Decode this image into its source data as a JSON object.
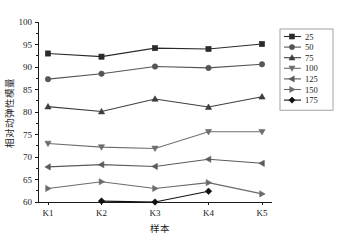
{
  "chart_data": {
    "type": "line",
    "title": "",
    "xlabel": "样本",
    "ylabel": "相对动弹性模量",
    "categories": [
      "K1",
      "K2",
      "K3",
      "K4",
      "K5"
    ],
    "ylim": [
      60,
      100
    ],
    "yticks": [
      60,
      65,
      70,
      75,
      80,
      85,
      90,
      95,
      100
    ],
    "grid": false,
    "legend_position": "right",
    "series": [
      {
        "name": "25",
        "marker": "square",
        "color": "#2b2b2b",
        "values": [
          93.0,
          92.3,
          94.2,
          94.0,
          95.1
        ]
      },
      {
        "name": "50",
        "marker": "circle",
        "color": "#555555",
        "values": [
          87.3,
          88.5,
          90.1,
          89.8,
          90.6
        ]
      },
      {
        "name": "75",
        "marker": "triangle-up",
        "color": "#3d3d3d",
        "values": [
          81.2,
          80.1,
          82.9,
          81.1,
          83.4
        ]
      },
      {
        "name": "100",
        "marker": "triangle-down",
        "color": "#6e6e6e",
        "values": [
          73.0,
          72.2,
          71.9,
          75.6,
          75.6
        ]
      },
      {
        "name": "125",
        "marker": "triangle-left",
        "color": "#5a5a5a",
        "values": [
          67.8,
          68.3,
          67.9,
          69.5,
          68.6
        ]
      },
      {
        "name": "150",
        "marker": "triangle-right",
        "color": "#6a6a6a",
        "values": [
          63.0,
          64.5,
          63.0,
          64.3,
          61.8
        ]
      },
      {
        "name": "175",
        "marker": "diamond",
        "color": "#111111",
        "values": [
          null,
          60.2,
          60.0,
          62.4,
          null
        ]
      }
    ]
  }
}
